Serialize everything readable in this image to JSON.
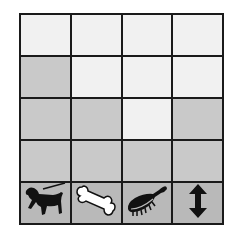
{
  "chart_data": {
    "type": "bar",
    "title": "",
    "xlabel": "",
    "ylabel": "",
    "grid": true,
    "rows": 4,
    "categories": [
      "walk-dog-icon",
      "bone-icon",
      "brush-icon",
      "up-down-arrow-icon"
    ],
    "values": [
      3,
      2,
      1,
      2
    ],
    "ylim": [
      0,
      4
    ]
  },
  "colors": {
    "empty": "#f1f1f1",
    "filled": "#c9c9c9",
    "icon_row": "#b9b9b9",
    "lines": "#1a1a1a"
  }
}
